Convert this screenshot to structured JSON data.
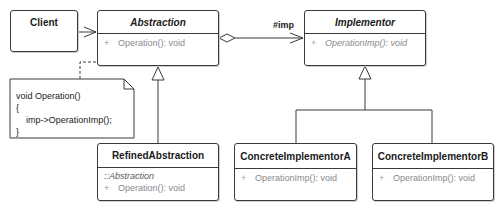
{
  "diagram": {
    "type": "uml-class-diagram",
    "pattern": "Bridge",
    "classes": [
      {
        "id": "client",
        "name": "Client",
        "abstract": false,
        "members": []
      },
      {
        "id": "abstraction",
        "name": "Abstraction",
        "abstract": true,
        "members": [
          {
            "visibility": "+",
            "signature": "Operation(): void",
            "abstract": false
          }
        ]
      },
      {
        "id": "implementor",
        "name": "Implementor",
        "abstract": true,
        "members": [
          {
            "visibility": "+",
            "signature": "OperationImp(): void",
            "abstract": true
          }
        ]
      },
      {
        "id": "refined_abstraction",
        "name": "RefinedAbstraction",
        "abstract": false,
        "inherited_from": "::Abstraction",
        "members": [
          {
            "visibility": "+",
            "signature": "Operation(): void",
            "abstract": false
          }
        ]
      },
      {
        "id": "concrete_implementor_a",
        "name": "ConcreteImplementorA",
        "abstract": false,
        "members": [
          {
            "visibility": "+",
            "signature": "OperationImp(): void",
            "abstract": false
          }
        ]
      },
      {
        "id": "concrete_implementor_b",
        "name": "ConcreteImplementorB",
        "abstract": false,
        "members": [
          {
            "visibility": "+",
            "signature": "OperationImp(): void",
            "abstract": false
          }
        ]
      }
    ],
    "note": {
      "lines": [
        "void Operation()",
        "{",
        "    imp->OperationImp();",
        "}"
      ],
      "attached_to": "abstraction"
    },
    "relationships": [
      {
        "type": "association",
        "from": "client",
        "to": "abstraction",
        "navigable": true
      },
      {
        "type": "aggregation",
        "from": "abstraction",
        "to": "implementor",
        "role": "#imp",
        "navigable": true
      },
      {
        "type": "generalization",
        "from": "refined_abstraction",
        "to": "abstraction"
      },
      {
        "type": "generalization",
        "from": "concrete_implementor_a",
        "to": "implementor"
      },
      {
        "type": "generalization",
        "from": "concrete_implementor_b",
        "to": "implementor"
      },
      {
        "type": "note-anchor",
        "from": "note",
        "to": "abstraction"
      }
    ],
    "colors": {
      "line": "#3a3a3a",
      "member_text": "#8a8a8a",
      "name_text": "#1a1a1a",
      "background": "#ffffff"
    }
  }
}
